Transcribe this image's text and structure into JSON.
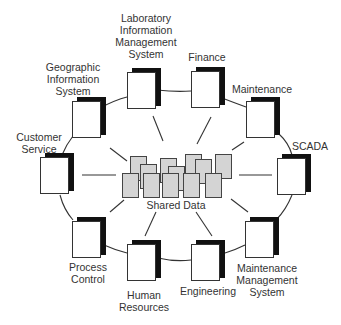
{
  "diagram": {
    "type": "hub-and-ring",
    "center": {
      "label": "Shared Data"
    },
    "nodes": [
      {
        "id": "lims",
        "label_lines": [
          "Laboratory",
          "Information",
          "Management",
          "System"
        ]
      },
      {
        "id": "finance",
        "label_lines": [
          "Finance"
        ]
      },
      {
        "id": "maintenance",
        "label_lines": [
          "Maintenance"
        ]
      },
      {
        "id": "scada",
        "label_lines": [
          "SCADA"
        ]
      },
      {
        "id": "mms",
        "label_lines": [
          "Maintenance",
          "Management",
          "System"
        ]
      },
      {
        "id": "engineering",
        "label_lines": [
          "Engineering"
        ]
      },
      {
        "id": "hr",
        "label_lines": [
          "Human",
          "Resources"
        ]
      },
      {
        "id": "process",
        "label_lines": [
          "Process",
          "Control"
        ]
      },
      {
        "id": "customer",
        "label_lines": [
          "Customer",
          "Service"
        ]
      },
      {
        "id": "gis",
        "label_lines": [
          "Geographic",
          "Information",
          "System"
        ]
      }
    ],
    "colors": {
      "shared_fill": "#d4d4d4",
      "shadow": "#111111",
      "line": "#333333"
    }
  }
}
